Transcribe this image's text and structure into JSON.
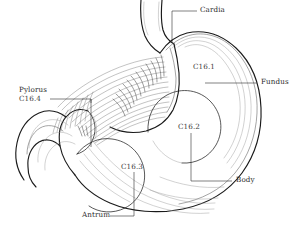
{
  "figure": {
    "background_color": "#ffffff",
    "outline_color": "#1a1a1a",
    "fold_color": "#6e6e6e",
    "label_color": "#2a2a2a"
  },
  "labels": {
    "cardia": "Cardia",
    "fundus": "Fundus",
    "body": "Body",
    "antrum": "Antrum",
    "pylorus": "Pylorus",
    "pylorus_code": "C16.4",
    "code_fundus": "C16.1",
    "code_body": "C16.2",
    "code_antrum": "C16.3"
  },
  "annotations": [
    {
      "id": "cardia",
      "text": "Cardia",
      "code": "",
      "position": "top-right",
      "leader": "elbow-left-down"
    },
    {
      "id": "fundus",
      "text": "Fundus",
      "code": "C16.1",
      "position": "right-upper",
      "leader": "horizontal-left"
    },
    {
      "id": "body",
      "text": "Body",
      "code": "C16.2",
      "position": "right-lower",
      "leader": "horizontal-left"
    },
    {
      "id": "antrum",
      "text": "Antrum",
      "code": "C16.3",
      "position": "bottom-left",
      "leader": "horizontal-right-up"
    },
    {
      "id": "pylorus",
      "text": "Pylorus",
      "code": "C16.4",
      "position": "left-upper",
      "leader": "elbow-right-down"
    }
  ],
  "regions": [
    {
      "code": "C16.1",
      "name": "Fundus",
      "label_x": 193,
      "label_y": 66
    },
    {
      "code": "C16.2",
      "name": "Body",
      "label_x": 178,
      "label_y": 126
    },
    {
      "code": "C16.3",
      "name": "Antrum",
      "label_x": 122,
      "label_y": 166
    },
    {
      "code": "C16.4",
      "name": "Pylorus",
      "label_x": 24,
      "label_y": 95
    }
  ]
}
